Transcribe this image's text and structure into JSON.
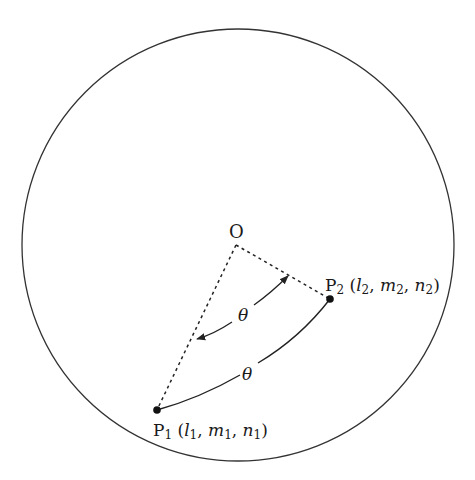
{
  "diagram": {
    "type": "spherical-angle-between-two-points",
    "sphere": {
      "cx": 238,
      "cy": 245,
      "r": 215,
      "stroke": "#333333"
    },
    "center": {
      "label": "O",
      "x": 236,
      "y": 245
    },
    "points": [
      {
        "id": "P1",
        "x": 157,
        "y": 410,
        "label_main": "P",
        "label_sub": "1",
        "coords_open": " (",
        "coords": [
          {
            "v": "l",
            "s": "1"
          },
          {
            "v": "m",
            "s": "1"
          },
          {
            "v": "n",
            "s": "1"
          }
        ],
        "coords_close": ")"
      },
      {
        "id": "P2",
        "x": 330,
        "y": 299,
        "label_main": "P",
        "label_sub": "2",
        "coords_open": " (",
        "coords": [
          {
            "v": "l",
            "s": "2"
          },
          {
            "v": "m",
            "s": "2"
          },
          {
            "v": "n",
            "s": "2"
          }
        ],
        "coords_close": ")"
      }
    ],
    "edges": [
      {
        "from": "O",
        "to": "P1",
        "style": "dashed"
      },
      {
        "from": "O",
        "to": "P2",
        "style": "dashed"
      },
      {
        "from": "P2",
        "to": "P1",
        "style": "solid-arc",
        "label": "θ"
      }
    ],
    "angle_marker": {
      "label": "θ",
      "style": "double-arrow-arc",
      "between": [
        "OP2",
        "OP1"
      ]
    },
    "separator": ", "
  }
}
